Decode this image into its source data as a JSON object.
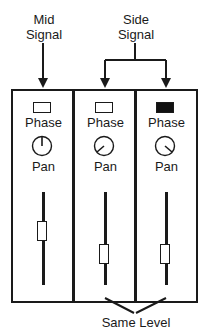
{
  "diagram": {
    "labels": {
      "mid_signal": "Mid\nSignal",
      "mid_line1": "Mid",
      "mid_line2": "Signal",
      "side_line1": "Side",
      "side_line2": "Signal",
      "same_level": "Same Level"
    },
    "channels": [
      {
        "phase_label": "Phase",
        "phase_on": false,
        "pan_label": "Pan",
        "pan_position": "center",
        "fader_position": "mid"
      },
      {
        "phase_label": "Phase",
        "phase_on": false,
        "pan_label": "Pan",
        "pan_position": "left",
        "fader_position": "low"
      },
      {
        "phase_label": "Phase",
        "phase_on": true,
        "pan_label": "Pan",
        "pan_position": "right",
        "fader_position": "low"
      }
    ],
    "colors": {
      "ink": "#1a1a1a",
      "background": "#ffffff"
    }
  }
}
